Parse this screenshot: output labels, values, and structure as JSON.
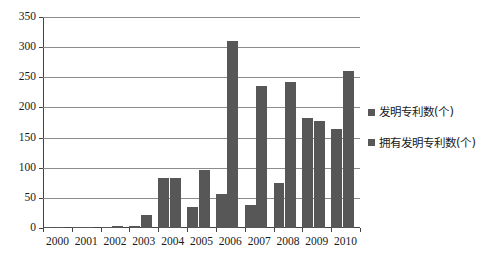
{
  "chart_data": {
    "type": "bar",
    "title": "",
    "xlabel": "",
    "ylabel": "",
    "ylim": [
      0,
      350
    ],
    "ytick_step": 50,
    "yticks": [
      "0",
      "50",
      "100",
      "150",
      "200",
      "250",
      "300",
      "350"
    ],
    "grid": true,
    "legend_position": "right",
    "bar_color": "#575757",
    "categories": [
      "2000",
      "2001",
      "2002",
      "2003",
      "2004",
      "2005",
      "2006",
      "2007",
      "2008",
      "2009",
      "2010"
    ],
    "series": [
      {
        "name": "发明专利数(个)",
        "values": [
          1,
          1,
          1,
          4,
          83,
          35,
          56,
          38,
          75,
          183,
          165
        ]
      },
      {
        "name": "拥有发明专利数(个)",
        "values": [
          2,
          1,
          4,
          21,
          83,
          96,
          311,
          236,
          242,
          178,
          260
        ]
      }
    ]
  }
}
